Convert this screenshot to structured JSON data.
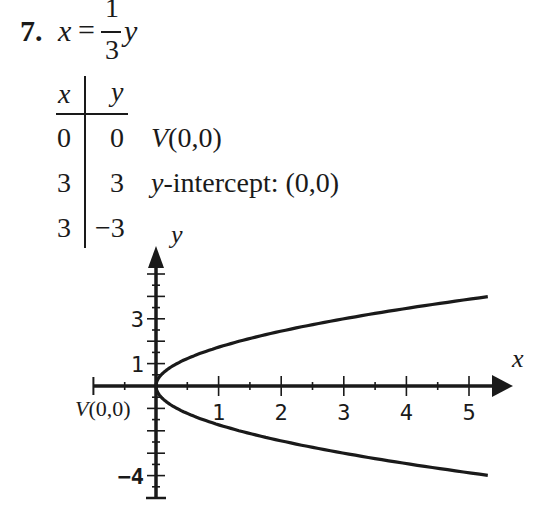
{
  "problem": {
    "number": "7.",
    "lhs": "x",
    "equals": "=",
    "frac_num": "1",
    "frac_den": "3",
    "rhs_var": "y"
  },
  "table": {
    "headers": [
      "x",
      "y"
    ],
    "rows": [
      {
        "x": "0",
        "y": "0",
        "note_prefix": "V",
        "note": "(0,0)"
      },
      {
        "x": "3",
        "y": "3",
        "note_prefix": "y",
        "note": "-intercept: (0,0)"
      },
      {
        "x": "3",
        "y": "−3",
        "note_prefix": "",
        "note": ""
      }
    ]
  },
  "chart_data": {
    "type": "line",
    "title": "",
    "equation": "x = (1/3) y^2",
    "xlabel": "x",
    "ylabel": "y",
    "xlim": [
      -1,
      5.5
    ],
    "ylim": [
      -5,
      5.5
    ],
    "x_tick_labels": [
      {
        "value": 1,
        "label": "1"
      },
      {
        "value": 2,
        "label": "2"
      },
      {
        "value": 3,
        "label": "3"
      },
      {
        "value": 4,
        "label": "4"
      },
      {
        "value": 5,
        "label": "5"
      }
    ],
    "y_tick_labels": [
      {
        "value": 3,
        "label": "3"
      },
      {
        "value": 1,
        "label": "1"
      },
      {
        "value": -4,
        "label": "−4"
      }
    ],
    "vertex_label": "V(0,0)",
    "series": [
      {
        "name": "upper branch",
        "x_from": 0,
        "x_to": 5.3,
        "points": [
          [
            0,
            0
          ],
          [
            0.333,
            1
          ],
          [
            1.333,
            2
          ],
          [
            3,
            3
          ],
          [
            5.3,
            3.99
          ]
        ]
      },
      {
        "name": "lower branch",
        "x_from": 0,
        "x_to": 5.3,
        "points": [
          [
            0,
            0
          ],
          [
            0.333,
            -1
          ],
          [
            1.333,
            -2
          ],
          [
            3,
            -3
          ],
          [
            5.3,
            -3.99
          ]
        ]
      }
    ],
    "grid": false
  }
}
